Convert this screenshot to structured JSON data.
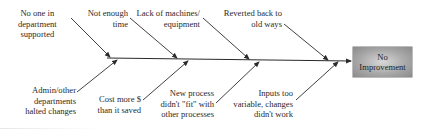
{
  "diagram": {
    "type": "fishbone",
    "effect": {
      "label": "No\nImprovement"
    },
    "top_causes": [
      {
        "label": "No one in\ndepartment\nsupported"
      },
      {
        "label": "Not enough\ntime"
      },
      {
        "label": "Lack of machines/\nequipment"
      },
      {
        "label": "Reverted back to\nold ways"
      }
    ],
    "bottom_causes": [
      {
        "label": "Admin/other\ndepartments\nhalted changes"
      },
      {
        "label": "Cost more $\nthan it saved"
      },
      {
        "label": "New process\ndidn't \"fit\" with\nother processes"
      },
      {
        "label": "Inputs too\nvariable, changes\ndidn't work"
      }
    ],
    "colors": {
      "line": "#2b2b2b",
      "text": "#2a2a2a",
      "effect_box_light": "#d8d8d8",
      "effect_box_dark": "#8a8a8a"
    }
  }
}
